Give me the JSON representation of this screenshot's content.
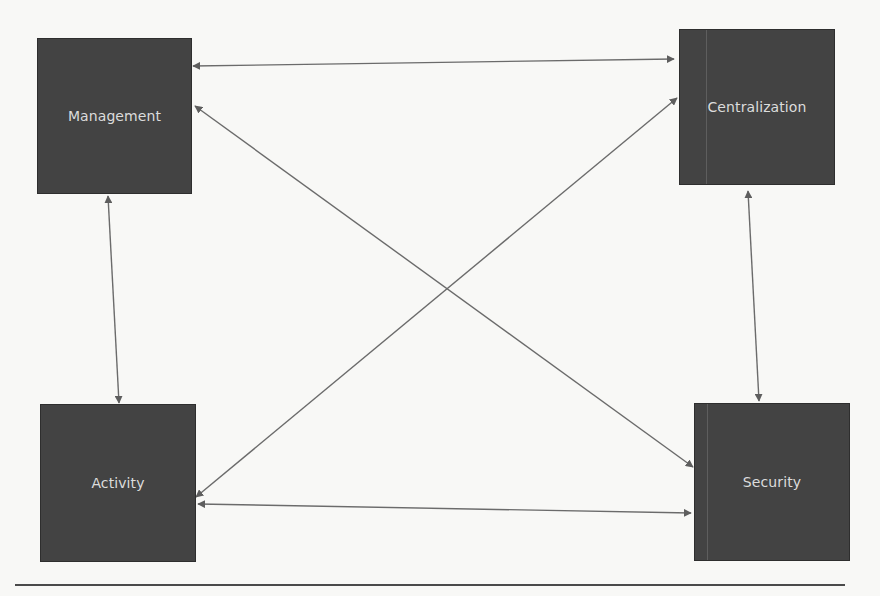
{
  "diagram": {
    "type": "relationship-diagram",
    "colors": {
      "background": "#f8f8f6",
      "node_fill": "#434343",
      "node_text": "#dcdcdc",
      "edge": "#6b6b6b"
    },
    "nodes": [
      {
        "id": "management",
        "label": "Management",
        "x": 37,
        "y": 38,
        "w": 155,
        "h": 156
      },
      {
        "id": "centralization",
        "label": "Centralization",
        "x": 679,
        "y": 29,
        "w": 156,
        "h": 156
      },
      {
        "id": "activity",
        "label": "Activity",
        "x": 40,
        "y": 404,
        "w": 156,
        "h": 158
      },
      {
        "id": "security",
        "label": "Security",
        "x": 694,
        "y": 403,
        "w": 156,
        "h": 158
      }
    ],
    "edges": [
      {
        "from": "management",
        "to": "centralization",
        "direction": "bidirectional",
        "x1": 193,
        "y1": 66,
        "x2": 674,
        "y2": 59
      },
      {
        "from": "management",
        "to": "security",
        "direction": "bidirectional",
        "x1": 195,
        "y1": 106,
        "x2": 693,
        "y2": 467
      },
      {
        "from": "centralization",
        "to": "activity",
        "direction": "bidirectional",
        "x1": 677,
        "y1": 98,
        "x2": 196,
        "y2": 497
      },
      {
        "from": "management",
        "to": "activity",
        "direction": "bidirectional",
        "x1": 108,
        "y1": 196,
        "x2": 119,
        "y2": 403
      },
      {
        "from": "centralization",
        "to": "security",
        "direction": "bidirectional",
        "x1": 748,
        "y1": 191,
        "x2": 759,
        "y2": 401
      },
      {
        "from": "activity",
        "to": "security",
        "direction": "bidirectional",
        "x1": 198,
        "y1": 504,
        "x2": 691,
        "y2": 513
      }
    ]
  }
}
